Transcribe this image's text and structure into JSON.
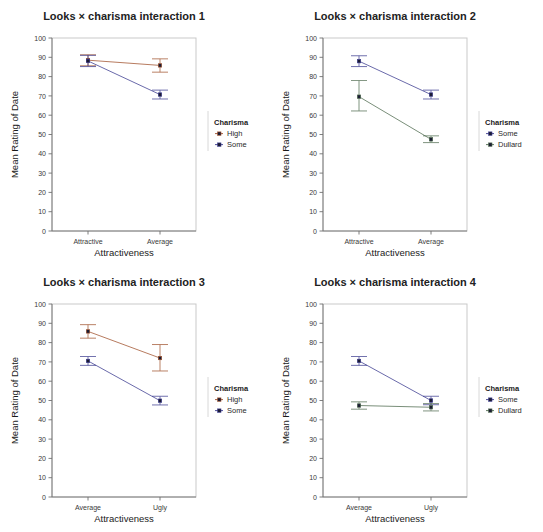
{
  "figure": {
    "width": 543,
    "height": 532,
    "background": "#ffffff",
    "layout": "2x2 grid of interaction line plots"
  },
  "colors": {
    "high": "#a0522d",
    "some": "#3b3b8f",
    "dullard": "#4f6b4f",
    "frame": "#c9c9c9",
    "axis": "#707070",
    "text": "#1a1a1a"
  },
  "axis": {
    "ylabel": "Mean Rating of Date",
    "xlabel": "Attractiveness",
    "yticks": [
      0,
      10,
      20,
      30,
      40,
      50,
      60,
      70,
      80,
      90,
      100
    ],
    "ylim": [
      0,
      100
    ],
    "grid": false
  },
  "legend": {
    "title": "Charisma",
    "position": "right"
  },
  "chart_data": [
    {
      "id": "panel-1",
      "type": "line",
      "title": "Looks × charisma interaction 1",
      "xlabel": "Attractiveness",
      "ylabel": "Mean Rating of Date",
      "ylim": [
        0,
        100
      ],
      "yticks": [
        0,
        10,
        20,
        30,
        40,
        50,
        60,
        70,
        80,
        90,
        100
      ],
      "grid": false,
      "categories": [
        "Attractive",
        "Average"
      ],
      "legend_title": "Charisma",
      "legend_position": "right",
      "series": [
        {
          "name": "High",
          "color": "#a0522d",
          "values": [
            88.5,
            85.8
          ],
          "err_low": [
            85.6,
            82.3
          ],
          "err_high": [
            91.3,
            89.2
          ]
        },
        {
          "name": "Some",
          "color": "#3b3b8f",
          "values": [
            88.1,
            70.7
          ],
          "err_low": [
            85.2,
            68.4
          ],
          "err_high": [
            91.0,
            73.0
          ]
        }
      ]
    },
    {
      "id": "panel-2",
      "type": "line",
      "title": "Looks × charisma interaction 2",
      "xlabel": "Attractiveness",
      "ylabel": "Mean Rating of Date",
      "ylim": [
        0,
        100
      ],
      "yticks": [
        0,
        10,
        20,
        30,
        40,
        50,
        60,
        70,
        80,
        90,
        100
      ],
      "grid": false,
      "categories": [
        "Attractive",
        "Average"
      ],
      "legend_title": "Charisma",
      "legend_position": "right",
      "series": [
        {
          "name": "Some",
          "color": "#3b3b8f",
          "values": [
            88.0,
            70.7
          ],
          "err_low": [
            85.2,
            68.4
          ],
          "err_high": [
            90.8,
            73.0
          ]
        },
        {
          "name": "Dullard",
          "color": "#4f6b4f",
          "values": [
            69.6,
            47.5
          ],
          "err_low": [
            62.2,
            45.8
          ],
          "err_high": [
            78.0,
            49.3
          ]
        }
      ]
    },
    {
      "id": "panel-3",
      "type": "line",
      "title": "Looks × charisma interaction 3",
      "xlabel": "Attractiveness",
      "ylabel": "Mean Rating of Date",
      "ylim": [
        0,
        100
      ],
      "yticks": [
        0,
        10,
        20,
        30,
        40,
        50,
        60,
        70,
        80,
        90,
        100
      ],
      "grid": false,
      "categories": [
        "Average",
        "Ugly"
      ],
      "legend_title": "Charisma",
      "legend_position": "right",
      "series": [
        {
          "name": "High",
          "color": "#a0522d",
          "values": [
            85.8,
            72.0
          ],
          "err_low": [
            82.3,
            65.3
          ],
          "err_high": [
            89.3,
            79.0
          ]
        },
        {
          "name": "Some",
          "color": "#3b3b8f",
          "values": [
            70.5,
            49.9
          ],
          "err_low": [
            68.2,
            47.7
          ],
          "err_high": [
            72.8,
            52.2
          ]
        }
      ]
    },
    {
      "id": "panel-4",
      "type": "line",
      "title": "Looks × charisma interaction 4",
      "xlabel": "Attractiveness",
      "ylabel": "Mean Rating of Date",
      "ylim": [
        0,
        100
      ],
      "yticks": [
        0,
        10,
        20,
        30,
        40,
        50,
        60,
        70,
        80,
        90,
        100
      ],
      "grid": false,
      "categories": [
        "Average",
        "Ugly"
      ],
      "legend_title": "Charisma",
      "legend_position": "right",
      "series": [
        {
          "name": "Some",
          "color": "#3b3b8f",
          "values": [
            70.5,
            50.0
          ],
          "err_low": [
            68.2,
            47.8
          ],
          "err_high": [
            72.8,
            52.2
          ]
        },
        {
          "name": "Dullard",
          "color": "#4f6b4f",
          "values": [
            47.4,
            46.5
          ],
          "err_low": [
            45.5,
            44.6
          ],
          "err_high": [
            49.3,
            48.4
          ]
        }
      ]
    }
  ]
}
